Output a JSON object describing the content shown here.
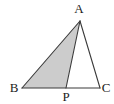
{
  "figure": {
    "type": "geometry-diagram",
    "shape": "triangle-with-cevian",
    "background_color": "#ffffff",
    "stroke_color": "#3a3a3a",
    "shaded_fill_color": "#cccccc",
    "unshaded_fill_color": "#ffffff",
    "stroke_width": "1.1",
    "points": {
      "A": {
        "label": "A",
        "x": 80,
        "y": 21,
        "label_x": 79,
        "label_y": 13
      },
      "B": {
        "label": "B",
        "x": 22,
        "y": 88,
        "label_x": 14,
        "label_y": 92
      },
      "C": {
        "label": "C",
        "x": 100,
        "y": 88,
        "label_x": 106,
        "label_y": 92
      },
      "P": {
        "label": "P",
        "x": 66,
        "y": 88,
        "label_x": 66,
        "label_y": 101
      }
    },
    "segments": [
      {
        "name": "AB",
        "from": "A",
        "to": "B"
      },
      {
        "name": "BC",
        "from": "B",
        "to": "C"
      },
      {
        "name": "CA",
        "from": "C",
        "to": "A"
      },
      {
        "name": "AP",
        "from": "A",
        "to": "P"
      }
    ],
    "regions": [
      {
        "name": "ABP",
        "vertices": [
          "A",
          "B",
          "P"
        ],
        "shaded": true
      },
      {
        "name": "APC",
        "vertices": [
          "A",
          "P",
          "C"
        ],
        "shaded": false
      }
    ]
  }
}
